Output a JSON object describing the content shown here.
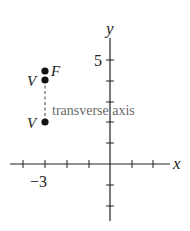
{
  "diagram": {
    "axes": {
      "x_label": "x",
      "y_label": "y",
      "x_tick_label": "−3",
      "y_tick_label": "5"
    },
    "points": [
      {
        "label": "F",
        "x": -3,
        "y": 4.5
      },
      {
        "label": "V",
        "x": -3,
        "y": 4
      },
      {
        "label": "V",
        "x": -3,
        "y": 2
      }
    ],
    "annotation": "transverse axis",
    "colors": {
      "axis": "#222222",
      "point": "#111111",
      "annotation": "#6a6a6a"
    }
  }
}
